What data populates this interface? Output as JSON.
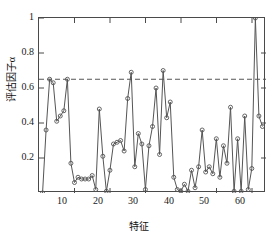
{
  "chart_data": {
    "type": "line",
    "title": "",
    "xlabel": "特征",
    "ylabel": "评估因子α",
    "ylabel_text": "评估因子",
    "ylabel_symbol": "α",
    "xlim": [
      0,
      64
    ],
    "ylim": [
      0,
      1
    ],
    "grid": false,
    "legend": null,
    "marker": "circle-open",
    "line_color": "#555555",
    "marker_color": "#555555",
    "threshold_color": "#555555",
    "xticks": [
      10,
      20,
      30,
      40,
      50,
      60
    ],
    "xtick_labels": [
      "10",
      "20",
      "30",
      "40",
      "50",
      "60"
    ],
    "yticks": [
      0.2,
      0.4,
      0.6,
      0.8,
      1
    ],
    "ytick_labels": [
      "0.2",
      "0.4",
      "0.6",
      "0.8",
      "1"
    ],
    "annotations": [
      {
        "kind": "hline",
        "label": "threshold",
        "y": 0.65,
        "style": "dashed"
      }
    ],
    "x": [
      1,
      2,
      3,
      4,
      5,
      6,
      7,
      8,
      9,
      10,
      11,
      12,
      13,
      14,
      15,
      16,
      17,
      18,
      19,
      20,
      21,
      22,
      23,
      24,
      25,
      26,
      27,
      28,
      29,
      30,
      31,
      32,
      33,
      34,
      35,
      36,
      37,
      38,
      39,
      40,
      41,
      42,
      43,
      44,
      45,
      46,
      47,
      48,
      49,
      50,
      51,
      52,
      53,
      54,
      55,
      56,
      57,
      58,
      59,
      60,
      61,
      62,
      63
    ],
    "values": [
      0.0,
      0.36,
      0.65,
      0.63,
      0.41,
      0.44,
      0.47,
      0.65,
      0.17,
      0.06,
      0.09,
      0.08,
      0.08,
      0.08,
      0.1,
      0.02,
      0.48,
      0.21,
      0.01,
      0.13,
      0.28,
      0.29,
      0.3,
      0.24,
      0.54,
      0.69,
      0.15,
      0.34,
      0.28,
      0.02,
      0.27,
      0.38,
      0.6,
      0.22,
      0.7,
      0.43,
      0.52,
      0.09,
      0.02,
      0.01,
      0.05,
      0.01,
      0.13,
      0.03,
      0.15,
      0.36,
      0.12,
      0.15,
      0.11,
      0.31,
      0.09,
      0.27,
      0.17,
      0.49,
      0.01,
      0.31,
      0.01,
      0.44,
      0.02,
      0.14,
      1.0,
      0.44,
      0.38
    ],
    "series": [
      {
        "name": "评估因子α",
        "values": [
          0.0,
          0.36,
          0.65,
          0.63,
          0.41,
          0.44,
          0.47,
          0.65,
          0.17,
          0.06,
          0.09,
          0.08,
          0.08,
          0.08,
          0.1,
          0.02,
          0.48,
          0.21,
          0.01,
          0.13,
          0.28,
          0.29,
          0.3,
          0.24,
          0.54,
          0.69,
          0.15,
          0.34,
          0.28,
          0.02,
          0.27,
          0.38,
          0.6,
          0.22,
          0.7,
          0.43,
          0.52,
          0.09,
          0.02,
          0.01,
          0.05,
          0.01,
          0.13,
          0.03,
          0.15,
          0.36,
          0.12,
          0.15,
          0.11,
          0.31,
          0.09,
          0.27,
          0.17,
          0.49,
          0.01,
          0.31,
          0.01,
          0.44,
          0.02,
          0.14,
          1.0,
          0.44,
          0.38
        ]
      }
    ]
  }
}
